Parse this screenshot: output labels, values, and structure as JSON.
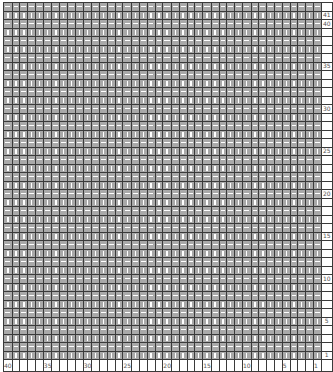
{
  "chart": {
    "title": "",
    "rows": 42,
    "columns": 40,
    "stitch_color": "#a9a9a9",
    "grid_color": "#3a3a3a",
    "symbols": {
      "odd_rows": "knit (vertical bar)",
      "even_rows": "purl (horizontal dash)"
    },
    "row_labels": {
      "41": "41",
      "40": "40",
      "35": "35",
      "30": "30",
      "25": "25",
      "20": "20",
      "15": "15",
      "10": "10",
      "5": "5",
      "1": "1"
    },
    "column_labels": {
      "40": "40",
      "35": "35",
      "30": "30",
      "25": "25",
      "20": "20",
      "15": "15",
      "10": "10",
      "5": "5",
      "1": "1"
    }
  }
}
